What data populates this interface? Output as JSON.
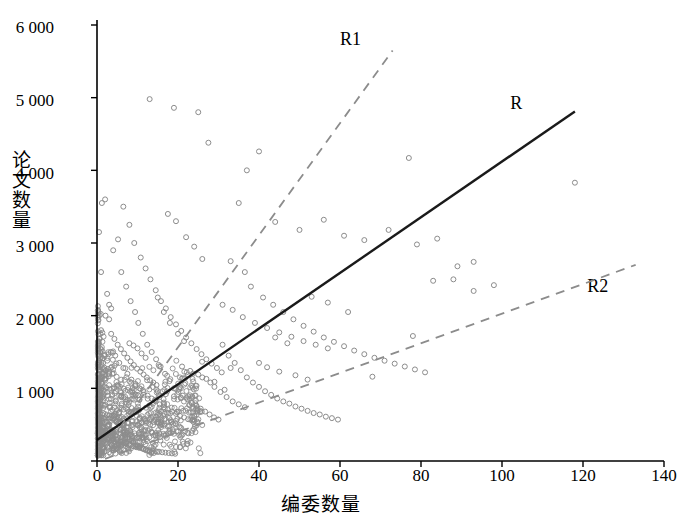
{
  "chart_data": {
    "type": "scatter",
    "title": "",
    "xlabel": "编委数量",
    "ylabel": "论文数量",
    "xlim": [
      0,
      140
    ],
    "ylim": [
      0,
      6000
    ],
    "xticks": [
      "0",
      "20",
      "40",
      "60",
      "80",
      "100",
      "120",
      "140"
    ],
    "yticks": [
      "0",
      "1 000",
      "2 000",
      "3 000",
      "4 000",
      "5 000",
      "6 000"
    ],
    "grid": false,
    "legend_position": "inline-annotations",
    "marker": {
      "shape": "open-circle",
      "color": "#8c8c8c",
      "size": 5
    },
    "series": [
      {
        "name": "R",
        "type": "line",
        "style": "solid",
        "color": "#1a1a1a",
        "label": "R",
        "label_x": 104,
        "label_y": 4900,
        "points": [
          [
            0,
            290
          ],
          [
            118,
            4810
          ]
        ]
      },
      {
        "name": "R1",
        "type": "line",
        "style": "dashed",
        "color": "#8c8c8c",
        "label": "R1",
        "label_x": 62,
        "label_y": 5780,
        "points": [
          [
            1,
            100
          ],
          [
            73,
            5650
          ]
        ]
      },
      {
        "name": "R2",
        "type": "line",
        "style": "dashed",
        "color": "#8c8c8c",
        "label": "R2",
        "label_x": 123,
        "label_y": 2380,
        "points": [
          [
            2,
            30
          ],
          [
            133,
            2700
          ]
        ]
      }
    ],
    "scatter_points": [
      [
        0.5,
        3150
      ],
      [
        1.2,
        3550
      ],
      [
        2.1,
        2000
      ],
      [
        1.0,
        1800
      ],
      [
        0.8,
        1500
      ],
      [
        1.5,
        1350
      ],
      [
        2.2,
        1250
      ],
      [
        0.6,
        1150
      ],
      [
        1.1,
        1000
      ],
      [
        2.5,
        950
      ],
      [
        3.0,
        2150
      ],
      [
        3.4,
        1500
      ],
      [
        3.8,
        1200
      ],
      [
        4.2,
        1000
      ],
      [
        4.6,
        820
      ],
      [
        5.0,
        700
      ],
      [
        5.4,
        600
      ],
      [
        5.8,
        520
      ],
      [
        6.2,
        450
      ],
      [
        6.6,
        400
      ],
      [
        7.0,
        360
      ],
      [
        7.5,
        330
      ],
      [
        8.0,
        300
      ],
      [
        8.5,
        280
      ],
      [
        9.0,
        250
      ],
      [
        9.5,
        230
      ],
      [
        10.0,
        210
      ],
      [
        10.5,
        195
      ],
      [
        11.0,
        180
      ],
      [
        11.5,
        165
      ],
      [
        12.0,
        150
      ],
      [
        12.5,
        140
      ],
      [
        13.0,
        130
      ],
      [
        13.5,
        120
      ],
      [
        14.0,
        110
      ],
      [
        4.0,
        2900
      ],
      [
        5.2,
        3050
      ],
      [
        6.0,
        2600
      ],
      [
        7.2,
        2400
      ],
      [
        8.3,
        2200
      ],
      [
        9.4,
        2050
      ],
      [
        10.2,
        1900
      ],
      [
        11.3,
        1750
      ],
      [
        12.4,
        1600
      ],
      [
        13.5,
        1500
      ],
      [
        14.6,
        1400
      ],
      [
        15.7,
        1300
      ],
      [
        16.8,
        1200
      ],
      [
        17.9,
        1100
      ],
      [
        19.0,
        1000
      ],
      [
        20.1,
        950
      ],
      [
        21.2,
        900
      ],
      [
        22.3,
        850
      ],
      [
        23.4,
        800
      ],
      [
        24.5,
        760
      ],
      [
        25.6,
        720
      ],
      [
        26.7,
        680
      ],
      [
        27.8,
        640
      ],
      [
        28.9,
        600
      ],
      [
        30.0,
        570
      ],
      [
        6.5,
        3500
      ],
      [
        8.0,
        3250
      ],
      [
        9.2,
        3000
      ],
      [
        10.8,
        2800
      ],
      [
        12.0,
        2650
      ],
      [
        13.2,
        2500
      ],
      [
        14.5,
        2350
      ],
      [
        15.8,
        2200
      ],
      [
        17.0,
        2100
      ],
      [
        18.2,
        1980
      ],
      [
        19.5,
        1880
      ],
      [
        20.8,
        1790
      ],
      [
        22.0,
        1700
      ],
      [
        23.3,
        1620
      ],
      [
        24.6,
        1540
      ],
      [
        25.8,
        1470
      ],
      [
        27.0,
        1400
      ],
      [
        28.3,
        1340
      ],
      [
        29.6,
        1280
      ],
      [
        30.8,
        1220
      ],
      [
        13.0,
        4980
      ],
      [
        19.0,
        4860
      ],
      [
        25.0,
        4800
      ],
      [
        27.5,
        4380
      ],
      [
        40.0,
        4260
      ],
      [
        77.0,
        4170
      ],
      [
        118.0,
        3830
      ],
      [
        37.0,
        4000
      ],
      [
        35.0,
        3550
      ],
      [
        44.0,
        3290
      ],
      [
        50.0,
        3180
      ],
      [
        56.0,
        3320
      ],
      [
        61.0,
        3100
      ],
      [
        66.0,
        3040
      ],
      [
        72.0,
        3180
      ],
      [
        79.0,
        2980
      ],
      [
        84.0,
        3060
      ],
      [
        89.0,
        2680
      ],
      [
        93.0,
        2340
      ],
      [
        98.0,
        2420
      ],
      [
        33.0,
        2750
      ],
      [
        36.5,
        2600
      ],
      [
        38.0,
        2400
      ],
      [
        41.0,
        2250
      ],
      [
        43.5,
        2150
      ],
      [
        46.0,
        2050
      ],
      [
        48.5,
        1950
      ],
      [
        51.0,
        1860
      ],
      [
        53.5,
        1780
      ],
      [
        56.0,
        1700
      ],
      [
        58.5,
        1640
      ],
      [
        61.0,
        1580
      ],
      [
        63.5,
        1520
      ],
      [
        66.0,
        1470
      ],
      [
        68.5,
        1420
      ],
      [
        71.0,
        1380
      ],
      [
        73.5,
        1340
      ],
      [
        76.0,
        1300
      ],
      [
        78.5,
        1260
      ],
      [
        81.0,
        1220
      ],
      [
        31.0,
        1600
      ],
      [
        32.5,
        1450
      ],
      [
        34.0,
        1350
      ],
      [
        35.5,
        1250
      ],
      [
        37.0,
        1150
      ],
      [
        38.5,
        1080
      ],
      [
        40.0,
        1020
      ],
      [
        41.5,
        960
      ],
      [
        43.0,
        910
      ],
      [
        44.5,
        860
      ],
      [
        46.0,
        820
      ],
      [
        47.5,
        790
      ],
      [
        49.0,
        750
      ],
      [
        50.5,
        720
      ],
      [
        52.0,
        690
      ],
      [
        53.5,
        660
      ],
      [
        55.0,
        640
      ],
      [
        56.5,
        610
      ],
      [
        58.0,
        590
      ],
      [
        59.5,
        570
      ],
      [
        30.5,
        950
      ],
      [
        32.0,
        880
      ],
      [
        33.5,
        820
      ],
      [
        35.0,
        780
      ],
      [
        36.5,
        740
      ],
      [
        20.0,
        1750
      ],
      [
        21.5,
        1650
      ],
      [
        18.0,
        1900
      ],
      [
        16.5,
        2050
      ],
      [
        15.0,
        2250
      ],
      [
        44.0,
        1700
      ],
      [
        47.0,
        1620
      ],
      [
        53.0,
        2260
      ],
      [
        57.0,
        2180
      ],
      [
        62.0,
        2050
      ],
      [
        68.0,
        1160
      ],
      [
        78.0,
        1720
      ],
      [
        83.0,
        2480
      ],
      [
        88.0,
        2500
      ],
      [
        93.0,
        2740
      ],
      [
        24.0,
        2950
      ],
      [
        26.0,
        2780
      ],
      [
        22.0,
        3080
      ],
      [
        19.5,
        3300
      ],
      [
        17.5,
        3400
      ],
      [
        2.0,
        600
      ],
      [
        2.4,
        540
      ],
      [
        2.8,
        480
      ],
      [
        3.2,
        430
      ],
      [
        3.6,
        390
      ],
      [
        1.8,
        760
      ],
      [
        1.4,
        880
      ],
      [
        0.9,
        980
      ],
      [
        0.4,
        1100
      ],
      [
        0.3,
        700
      ],
      [
        0.7,
        520
      ],
      [
        1.3,
        460
      ],
      [
        1.9,
        410
      ],
      [
        2.6,
        370
      ],
      [
        3.3,
        340
      ],
      [
        4.1,
        310
      ],
      [
        4.9,
        290
      ],
      [
        5.7,
        270
      ],
      [
        6.5,
        250
      ],
      [
        7.3,
        235
      ],
      [
        8.1,
        220
      ],
      [
        8.9,
        205
      ],
      [
        9.7,
        190
      ],
      [
        10.5,
        180
      ],
      [
        11.3,
        170
      ],
      [
        12.1,
        160
      ],
      [
        12.9,
        150
      ],
      [
        13.7,
        140
      ],
      [
        14.5,
        135
      ],
      [
        15.3,
        128
      ],
      [
        16.1,
        120
      ],
      [
        16.9,
        115
      ],
      [
        17.7,
        110
      ],
      [
        18.5,
        105
      ],
      [
        19.3,
        100
      ],
      [
        4.5,
        1450
      ],
      [
        5.5,
        1350
      ],
      [
        6.5,
        1280
      ],
      [
        7.5,
        1200
      ],
      [
        8.5,
        1120
      ],
      [
        9.5,
        1060
      ],
      [
        10.5,
        1000
      ],
      [
        11.5,
        950
      ],
      [
        12.5,
        900
      ],
      [
        13.5,
        860
      ],
      [
        14.5,
        820
      ],
      [
        15.5,
        780
      ],
      [
        16.5,
        740
      ],
      [
        17.5,
        710
      ],
      [
        18.5,
        680
      ],
      [
        19.5,
        650
      ],
      [
        20.5,
        620
      ],
      [
        21.5,
        600
      ],
      [
        22.5,
        575
      ],
      [
        23.5,
        555
      ],
      [
        3.5,
        1750
      ],
      [
        4.3,
        1680
      ],
      [
        5.1,
        1600
      ],
      [
        5.9,
        1540
      ],
      [
        6.7,
        1480
      ],
      [
        7.5,
        1420
      ],
      [
        8.3,
        1370
      ],
      [
        9.1,
        1320
      ],
      [
        9.9,
        1270
      ],
      [
        10.7,
        1230
      ],
      [
        11.5,
        1190
      ],
      [
        12.3,
        1150
      ],
      [
        13.1,
        1110
      ],
      [
        13.9,
        1080
      ],
      [
        14.7,
        1045
      ],
      [
        26.0,
        1150
      ],
      [
        28.0,
        1080
      ],
      [
        29.0,
        1020
      ],
      [
        31.5,
        980
      ],
      [
        33.0,
        1280
      ],
      [
        2.0,
        3600
      ],
      [
        1.0,
        2600
      ],
      [
        2.5,
        2300
      ],
      [
        3.0,
        1950
      ],
      [
        3.5,
        2100
      ],
      [
        10.0,
        1550
      ],
      [
        11.0,
        1480
      ],
      [
        12.0,
        1420
      ],
      [
        8.0,
        1620
      ],
      [
        9.0,
        1590
      ],
      [
        21.0,
        1300
      ],
      [
        23.0,
        1240
      ],
      [
        25.0,
        1190
      ],
      [
        27.0,
        1130
      ],
      [
        29.0,
        1090
      ],
      [
        6.0,
        900
      ],
      [
        7.0,
        850
      ],
      [
        15.0,
        960
      ],
      [
        17.0,
        920
      ],
      [
        19.0,
        890
      ],
      [
        40.0,
        1350
      ],
      [
        42.0,
        1290
      ],
      [
        45.0,
        1230
      ],
      [
        49.0,
        1180
      ],
      [
        52.0,
        1120
      ],
      [
        31.0,
        2150
      ],
      [
        33.5,
        2080
      ],
      [
        36.0,
        1980
      ],
      [
        39.0,
        1900
      ],
      [
        42.0,
        1830
      ],
      [
        45.0,
        1770
      ],
      [
        48.0,
        1710
      ],
      [
        51.0,
        1650
      ],
      [
        54.0,
        1600
      ],
      [
        57.0,
        1550
      ]
    ]
  },
  "annotations": {
    "r_label": "R",
    "r1_label": "R1",
    "r2_label": "R2"
  }
}
